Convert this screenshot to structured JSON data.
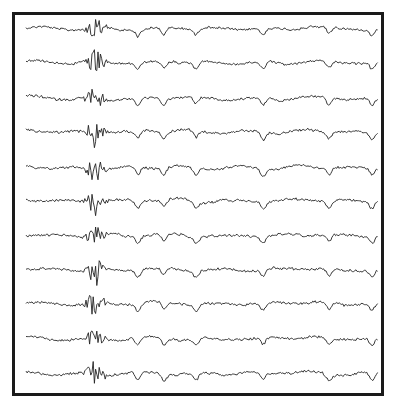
{
  "chart_data": {
    "type": "line",
    "title": "",
    "xlabel": "",
    "ylabel": "",
    "grid": false,
    "legend": null,
    "frame": {
      "x": 12,
      "y": 12,
      "width": 369,
      "height": 381,
      "stroke": "#1a1a1a",
      "stroke_width": 3
    },
    "x_range_px": [
      26,
      378
    ],
    "burst_center_px": 95,
    "slow_wave_dips_px": [
      138,
      164,
      196,
      263,
      329,
      372
    ],
    "channel_count": 11,
    "series": [
      {
        "name": "channel-1",
        "baseline_y": 29
      },
      {
        "name": "channel-2",
        "baseline_y": 63
      },
      {
        "name": "channel-3",
        "baseline_y": 99
      },
      {
        "name": "channel-4",
        "baseline_y": 132
      },
      {
        "name": "channel-5",
        "baseline_y": 168
      },
      {
        "name": "channel-6",
        "baseline_y": 201
      },
      {
        "name": "channel-7",
        "baseline_y": 236
      },
      {
        "name": "channel-8",
        "baseline_y": 270
      },
      {
        "name": "channel-9",
        "baseline_y": 304
      },
      {
        "name": "channel-10",
        "baseline_y": 339
      },
      {
        "name": "channel-11",
        "baseline_y": 374
      }
    ],
    "colors": {
      "trace": "#222222",
      "background": "#ffffff"
    }
  }
}
